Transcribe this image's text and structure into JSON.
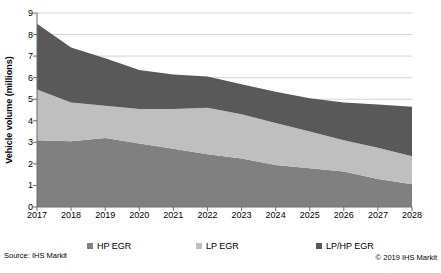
{
  "chart_data": {
    "type": "area",
    "stacked": true,
    "title": "",
    "xlabel": "",
    "ylabel": "Vehicle volume (millions)",
    "ylim": [
      0,
      9
    ],
    "yticks": [
      0,
      1,
      2,
      3,
      4,
      5,
      6,
      7,
      8,
      9
    ],
    "grid": true,
    "legend_position": "bottom",
    "categories": [
      "2017",
      "2018",
      "2019",
      "2020",
      "2021",
      "2022",
      "2023",
      "2024",
      "2025",
      "2026",
      "2027",
      "2028"
    ],
    "series": [
      {
        "name": "HP EGR",
        "color": "#808080",
        "values": [
          3.1,
          3.05,
          3.2,
          2.95,
          2.7,
          2.45,
          2.25,
          1.95,
          1.8,
          1.65,
          1.3,
          1.05
        ]
      },
      {
        "name": "LP EGR",
        "color": "#bfbfbf",
        "values": [
          2.35,
          1.8,
          1.5,
          1.6,
          1.85,
          2.15,
          2.05,
          1.95,
          1.7,
          1.45,
          1.45,
          1.3
        ]
      },
      {
        "name": "LP/HP EGR",
        "color": "#595959",
        "values": [
          3.05,
          2.55,
          2.2,
          1.8,
          1.6,
          1.45,
          1.4,
          1.45,
          1.55,
          1.75,
          2.0,
          2.3
        ]
      }
    ],
    "stacked_totals": [
      8.5,
      7.4,
      6.9,
      6.35,
      6.15,
      6.05,
      5.7,
      5.35,
      5.05,
      4.85,
      4.75,
      4.65
    ]
  },
  "colors": {
    "background": "#ffffff",
    "gridline": "#c9c9c9",
    "axis": "#6e6e6e",
    "text": "#000000"
  },
  "footer": {
    "source": "Source: IHS Markit",
    "copyright": "© 2019 IHS Markit"
  }
}
